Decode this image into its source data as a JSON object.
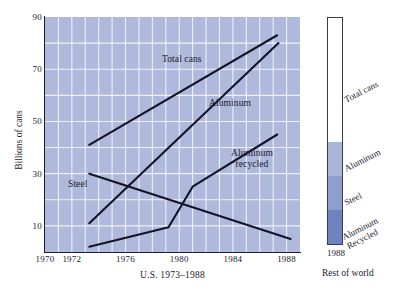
{
  "chart_data": {
    "type": "line",
    "title": "",
    "xlabel": "U.S. 1973–1988",
    "ylabel": "Billions of cans",
    "xlim": [
      1970,
      1989
    ],
    "ylim": [
      0,
      90
    ],
    "grid": true,
    "x_ticks": [
      {
        "value": 1970,
        "label": "1970"
      },
      {
        "value": 1972,
        "label": "1972"
      },
      {
        "value": 1976,
        "label": "1976"
      },
      {
        "value": 1980,
        "label": "1980"
      },
      {
        "value": 1984,
        "label": "1984"
      },
      {
        "value": 1988,
        "label": "1988"
      }
    ],
    "y_ticks": [
      {
        "value": 10,
        "label": "10"
      },
      {
        "value": 30,
        "label": "30"
      },
      {
        "value": 50,
        "label": "50"
      },
      {
        "value": 70,
        "label": "70"
      },
      {
        "value": 90,
        "label": "90"
      }
    ],
    "x_gridlines": [
      1971,
      1972,
      1973,
      1974,
      1975,
      1976,
      1977,
      1978,
      1979,
      1980,
      1981,
      1982,
      1983,
      1984,
      1985,
      1986,
      1987,
      1988
    ],
    "y_gridlines": [
      10,
      20,
      30,
      40,
      50,
      60,
      70,
      80
    ],
    "series": [
      {
        "name": "Total cans",
        "points": [
          [
            1973.3,
            41
          ],
          [
            1987.3,
            83
          ]
        ],
        "annotation": "Total cans"
      },
      {
        "name": "Aluminum",
        "points": [
          [
            1973.3,
            11
          ],
          [
            1987.4,
            80
          ]
        ],
        "annotation": "Aluminum"
      },
      {
        "name": "Steel",
        "points": [
          [
            1973.3,
            30
          ],
          [
            1988.3,
            5
          ]
        ],
        "annotation": "Steel"
      },
      {
        "name": "Aluminum recycled",
        "points": [
          [
            1973.3,
            2
          ],
          [
            1979.2,
            9.5
          ],
          [
            1981.0,
            25
          ],
          [
            1987.3,
            45
          ]
        ],
        "annotation": "Aluminum recycled"
      }
    ],
    "legend_position": "in-plot annotations",
    "line_color": "#141428",
    "plot_background": "#aeb9dc",
    "gridline_color": "#eef0f8"
  },
  "stacked_bar": {
    "year_label": "1988",
    "caption": "Rest of world",
    "segments": [
      {
        "label": "Total cans",
        "share": 55,
        "color": "#ffffff"
      },
      {
        "label": "Aluminum",
        "share": 15,
        "color": "#aab6d8"
      },
      {
        "label": "Steel",
        "share": 15,
        "color": "#8f9fcd"
      },
      {
        "label": "Aluminum Recycled",
        "share": 15,
        "color": "#6d83bd"
      }
    ]
  }
}
